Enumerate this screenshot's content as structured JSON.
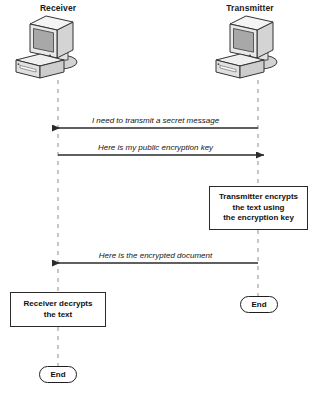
{
  "diagram": {
    "type": "sequence-diagram",
    "colors": {
      "lifeline": "#9b9b9b",
      "arrow": "#2b2b2b",
      "box_border": "#2a2a2a",
      "computer_screen": "#a8a8a8",
      "computer_body": "#d6d6d6",
      "computer_highlight": "#f2f2f2",
      "background": "#ffffff"
    },
    "actors": [
      {
        "id": "receiver",
        "label": "Receiver",
        "icon": "desktop-computer-icon",
        "lifeline_x": 58
      },
      {
        "id": "transmitter",
        "label": "Transmitter",
        "icon": "desktop-computer-icon",
        "lifeline_x": 258
      }
    ],
    "messages": [
      {
        "id": "msg-0",
        "label": "I need to transmit a secret message",
        "from": "transmitter",
        "to": "receiver",
        "direction": "left",
        "y": 128
      },
      {
        "id": "msg-1",
        "label": "Here is my public encryption key",
        "from": "receiver",
        "to": "transmitter",
        "direction": "right",
        "y": 155
      },
      {
        "id": "msg-2",
        "label": "Here is the encrypted document",
        "from": "transmitter",
        "to": "receiver",
        "direction": "left",
        "y": 263
      }
    ],
    "process_boxes": [
      {
        "id": "encrypt",
        "actor": "transmitter",
        "lines": [
          "Transmitter encrypts",
          "the text using",
          "the encryption key"
        ]
      },
      {
        "id": "decrypt",
        "actor": "receiver",
        "lines": [
          "Receiver decrypts",
          "the text"
        ]
      }
    ],
    "terminators": [
      {
        "id": "transmitter-end",
        "actor": "transmitter",
        "label": "End"
      },
      {
        "id": "receiver-end",
        "actor": "receiver",
        "label": "End"
      }
    ]
  }
}
